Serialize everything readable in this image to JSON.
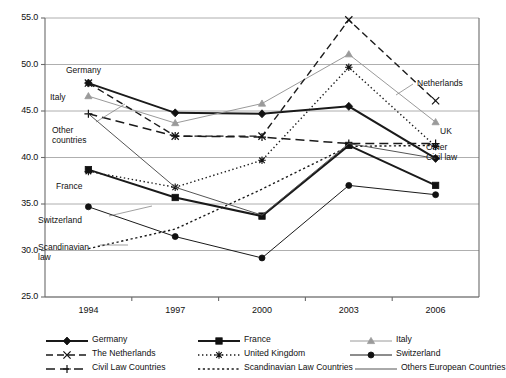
{
  "chart_data": {
    "type": "line",
    "title": "",
    "xlabel": "",
    "ylabel": "",
    "categories": [
      "1994",
      "1997",
      "2000",
      "2003",
      "2006"
    ],
    "x": [
      1994,
      1997,
      2000,
      2003,
      2006
    ],
    "ylim": [
      25.0,
      55.0
    ],
    "ytick_labels": [
      "25.0",
      "30.0",
      "35.0",
      "40.0",
      "45.0",
      "50.0",
      "55.0"
    ],
    "yticks": [
      25.0,
      30.0,
      35.0,
      40.0,
      45.0,
      50.0,
      55.0
    ],
    "grid": "horizontal",
    "legend_position": "below-axis",
    "series": [
      {
        "name": "Germany",
        "marker": "diamond",
        "line": "solid",
        "color": "#1a1a1a",
        "width": 2.0,
        "values": [
          48.0,
          44.8,
          44.7,
          45.5,
          39.9
        ]
      },
      {
        "name": "France",
        "marker": "square",
        "line": "solid",
        "color": "#1a1a1a",
        "width": 2.0,
        "values": [
          38.7,
          35.7,
          33.7,
          41.3,
          37.0
        ]
      },
      {
        "name": "Italy",
        "marker": "triangle",
        "line": "solid",
        "color": "#9a9a9a",
        "width": 1.0,
        "values": [
          46.6,
          43.7,
          45.8,
          51.1,
          43.8
        ]
      },
      {
        "name": "The Netherlands",
        "marker": "x",
        "line": "dashed",
        "color": "#1a1a1a",
        "width": 1.4,
        "values": [
          48.0,
          42.3,
          42.3,
          54.8,
          46.1
        ]
      },
      {
        "name": "United Kingdom",
        "marker": "asterisk",
        "line": "dotted",
        "color": "#1a1a1a",
        "width": 1.4,
        "values": [
          38.5,
          36.8,
          39.7,
          49.7,
          41.2
        ]
      },
      {
        "name": "Switzerland",
        "marker": "circle",
        "line": "solid",
        "color": "#1a1a1a",
        "width": 1.0,
        "values": [
          34.7,
          31.5,
          29.2,
          37.0,
          36.0
        ]
      },
      {
        "name": "Civil Law Countries",
        "marker": "plus",
        "line": "longdash",
        "color": "#1a1a1a",
        "width": 1.5,
        "values": [
          44.7,
          42.3,
          42.2,
          41.5,
          41.5
        ]
      },
      {
        "name": "Scandinavian Law Countries",
        "marker": "none",
        "line": "dashdotdot",
        "color": "#1a1a1a",
        "width": 1.4,
        "values": [
          30.2,
          32.3,
          36.6,
          41.2,
          41.3
        ]
      },
      {
        "name": "Others European Countries",
        "marker": "none",
        "line": "solid",
        "color": "#555555",
        "width": 1.0,
        "values": [
          44.7,
          36.8,
          33.8,
          41.5,
          39.9
        ]
      }
    ],
    "annotations": [
      {
        "text": "Germany",
        "x": 66,
        "y": 66,
        "align": "left"
      },
      {
        "text": "Italy",
        "x": 50,
        "y": 93,
        "align": "left"
      },
      {
        "text": "Other\ncountries",
        "x": 52,
        "y": 126,
        "align": "left"
      },
      {
        "text": "France",
        "x": 56,
        "y": 182,
        "align": "left"
      },
      {
        "text": "Switzerland",
        "x": 38,
        "y": 216,
        "align": "left"
      },
      {
        "text": "Scandinavian\nlaw",
        "x": 38,
        "y": 243,
        "align": "left"
      },
      {
        "text": "Netherlands",
        "x": 417,
        "y": 79,
        "align": "left"
      },
      {
        "text": "UK",
        "x": 440,
        "y": 127,
        "align": "left"
      },
      {
        "text": "Other\nCivil law",
        "x": 426,
        "y": 143,
        "align": "left"
      }
    ]
  },
  "axis": {
    "y_labels": [
      "55.0",
      "50.0",
      "45.0",
      "40.0",
      "35.0",
      "30.0",
      "25.0"
    ],
    "x_labels": [
      "1994",
      "1997",
      "2000",
      "2003",
      "2006"
    ]
  },
  "legend": {
    "rows": [
      [
        {
          "label": "Germany",
          "key": "germany-key"
        },
        {
          "label": "France",
          "key": "france-key"
        },
        {
          "label": "Italy",
          "key": "italy-key"
        }
      ],
      [
        {
          "label": "The Netherlands",
          "key": "netherlands-key"
        },
        {
          "label": "United Kingdom",
          "key": "uk-key"
        },
        {
          "label": "Switzerland",
          "key": "switzerland-key"
        }
      ],
      [
        {
          "label": "Civil Law Countries",
          "key": "civil-law-key"
        },
        {
          "label": "Scandinavian Law Countries",
          "key": "scandinavian-key"
        },
        {
          "label": "Others European Countries",
          "key": "others-key"
        }
      ]
    ]
  },
  "colors": {
    "axis": "#6b6b6b",
    "grid": "#9a9a9a",
    "text": "#111111",
    "gray_series": "#9a9a9a"
  }
}
